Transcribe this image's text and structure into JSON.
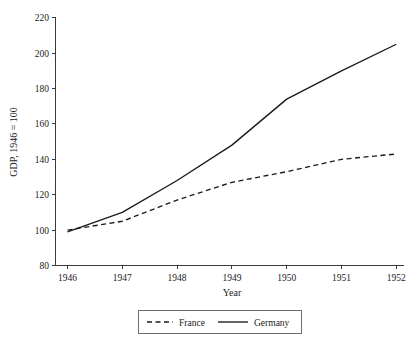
{
  "chart_data": {
    "type": "line",
    "title": "",
    "xlabel": "Year",
    "ylabel": "GDP, 1946 = 100",
    "x": [
      1946,
      1947,
      1948,
      1949,
      1950,
      1951,
      1952
    ],
    "xtick_labels": [
      "1946",
      "1947",
      "1948",
      "1949",
      "1950",
      "1951",
      "1952"
    ],
    "ytick_labels": [
      "80",
      "100",
      "120",
      "140",
      "160",
      "180",
      "200",
      "220"
    ],
    "yticks": [
      80,
      100,
      120,
      140,
      160,
      180,
      200,
      220
    ],
    "ylim": [
      80,
      220
    ],
    "xlim": [
      1946,
      1952
    ],
    "grid": false,
    "legend_position": "bottom-center",
    "series": [
      {
        "name": "France",
        "style": "dashed",
        "color": "#1a1a1a",
        "values": [
          100,
          105,
          117,
          127,
          133,
          140,
          143
        ]
      },
      {
        "name": "Germany",
        "style": "solid",
        "color": "#1a1a1a",
        "values": [
          99,
          110,
          128,
          148,
          174,
          190,
          205
        ]
      }
    ]
  },
  "legend": {
    "entries": [
      {
        "label": "France"
      },
      {
        "label": "Germany"
      }
    ]
  },
  "axes": {
    "y_title": "GDP, 1946 = 100",
    "x_title": "Year"
  }
}
